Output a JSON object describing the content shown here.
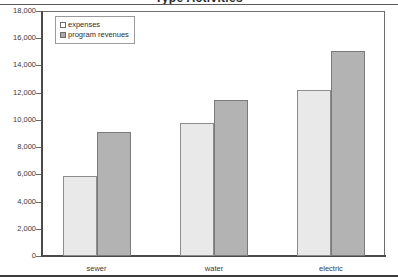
{
  "chart_data": {
    "type": "bar",
    "title": "Type Activities",
    "categories": [
      "sewer",
      "water",
      "electric"
    ],
    "series": [
      {
        "name": "expenses",
        "values": [
          5880,
          9770,
          12200
        ]
      },
      {
        "name": "program revenues",
        "values": [
          9110,
          11460,
          15060
        ]
      }
    ],
    "xlabel": "",
    "ylabel": "",
    "ylim": [
      0,
      18000
    ],
    "ytick_step": 2000,
    "ytick_labels": [
      "18,000",
      "16,000",
      "14,000",
      "12,000",
      "10,000",
      "8,000",
      "6,000",
      "4,000",
      "2,000",
      "0"
    ],
    "ytick_values": [
      18000,
      16000,
      14000,
      12000,
      10000,
      8000,
      6000,
      4000,
      2000,
      0
    ],
    "grid": false,
    "legend_position": "top-left",
    "colors": {
      "expenses": "#e9e9e9",
      "program revenues": "#b3b3b3",
      "axis": "#4a4a4a",
      "frame": "#6e6e6e",
      "text": "#3a3a3a"
    }
  },
  "legend": {
    "items": [
      {
        "label": "expenses",
        "swatch": "expenses-swatch"
      },
      {
        "label": "program revenues",
        "swatch": "program-revenues-swatch"
      }
    ]
  }
}
